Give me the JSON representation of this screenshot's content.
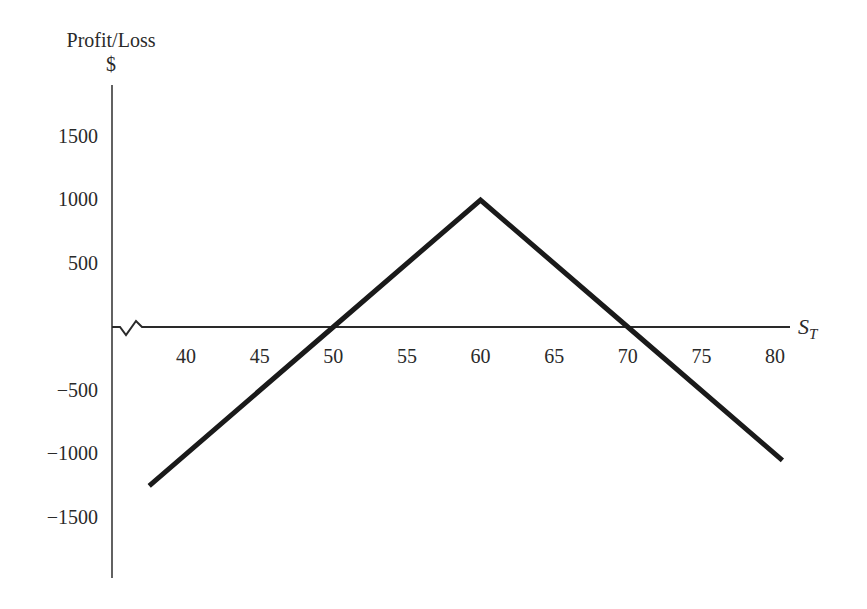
{
  "chart_data": {
    "type": "line",
    "title": "",
    "ylabel": "Profit/Loss",
    "ylabel_unit": "$",
    "xlabel": "S_T",
    "xlabel_main": "S",
    "xlabel_sub": "T",
    "x_ticks": [
      "40",
      "45",
      "50",
      "55",
      "60",
      "65",
      "70",
      "75",
      "80"
    ],
    "y_ticks": [
      "1500",
      "1000",
      "500",
      "−500",
      "−1000",
      "−1500"
    ],
    "xlim": [
      36,
      82
    ],
    "ylim": [
      -2000,
      1900
    ],
    "grid": false,
    "legend": null,
    "axis_break": "zigzag on x-axis near origin",
    "series": [
      {
        "name": "Profit/Loss",
        "x": [
          37.5,
          50,
          60,
          70,
          80.5
        ],
        "y": [
          -1250,
          0,
          1000,
          0,
          -1050
        ]
      }
    ]
  }
}
